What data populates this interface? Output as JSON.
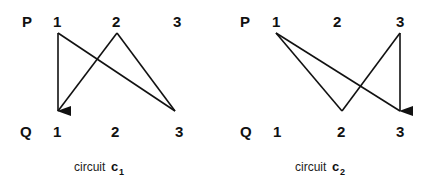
{
  "diagrams": [
    {
      "id": "c1",
      "top_row_label": "P",
      "bottom_row_label": "Q",
      "top_nodes": [
        "1",
        "2",
        "3"
      ],
      "bottom_nodes": [
        "1",
        "2",
        "3"
      ],
      "caption_text": "circuit",
      "caption_symbol": "c",
      "caption_subscript": "1",
      "edges": [
        {
          "from": "P1",
          "to": "Q3",
          "arrow": false
        },
        {
          "from": "Q3",
          "to": "P2",
          "arrow": false
        },
        {
          "from": "P2",
          "to": "Q1",
          "arrow": false
        },
        {
          "from": "P1",
          "to": "Q1",
          "arrow": true
        }
      ]
    },
    {
      "id": "c2",
      "top_row_label": "P",
      "bottom_row_label": "Q",
      "top_nodes": [
        "1",
        "2",
        "3"
      ],
      "bottom_nodes": [
        "1",
        "2",
        "3"
      ],
      "caption_text": "circuit",
      "caption_symbol": "c",
      "caption_subscript": "2",
      "edges": [
        {
          "from": "P1",
          "to": "Q3",
          "arrow": false
        },
        {
          "from": "P1",
          "to": "Q2",
          "arrow": false
        },
        {
          "from": "Q2",
          "to": "P3",
          "arrow": false
        },
        {
          "from": "P3",
          "to": "Q3",
          "arrow": true
        }
      ]
    }
  ]
}
